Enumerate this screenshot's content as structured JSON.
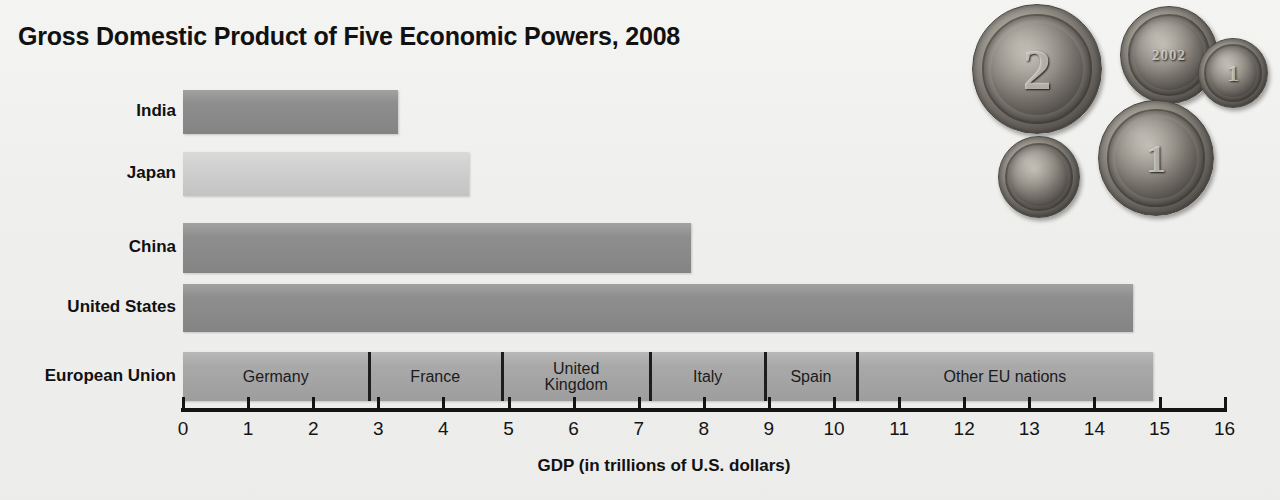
{
  "chart_data": {
    "type": "bar",
    "orientation": "horizontal",
    "title": "Gross Domestic Product of Five Economic Powers, 2008",
    "xlabel": "GDP (in trillions of U.S. dollars)",
    "ylabel": "",
    "xlim": [
      0,
      16
    ],
    "xticks": [
      0,
      1,
      2,
      3,
      4,
      5,
      6,
      7,
      8,
      9,
      10,
      11,
      12,
      13,
      14,
      15,
      16
    ],
    "grid": false,
    "legend": "none",
    "categories": [
      "India",
      "Japan",
      "China",
      "United States",
      "European Union"
    ],
    "values": [
      3.3,
      4.4,
      7.8,
      14.6,
      14.9
    ],
    "bar_colors": [
      "#8e8e8e",
      "#d2d2d2",
      "#8e8e8e",
      "#8e8e8e",
      "#a9a9a9"
    ],
    "stacked_category": "European Union",
    "segments": [
      {
        "label": "Germany",
        "value": 2.85,
        "start": 0.0,
        "end": 2.85
      },
      {
        "label": "France",
        "value": 2.05,
        "start": 2.85,
        "end": 4.9
      },
      {
        "label": "United\nKingdom",
        "value": 2.28,
        "start": 4.9,
        "end": 7.18
      },
      {
        "label": "Italy",
        "value": 1.76,
        "start": 7.18,
        "end": 8.94
      },
      {
        "label": "Spain",
        "value": 1.41,
        "start": 8.94,
        "end": 10.35
      },
      {
        "label": "Other EU nations",
        "value": 4.55,
        "start": 10.35,
        "end": 14.9
      }
    ]
  },
  "figure": {
    "title": "Gross Domestic Product of Five Economic Powers, 2008",
    "axis_title": "GDP (in trillions of U.S. dollars)",
    "background_color": "#f1f1ef",
    "axis_color": "#141414"
  },
  "photo": {
    "name": "euro-coins-photograph",
    "coins": [
      {
        "id": "coin-2euro",
        "glyph": "2"
      },
      {
        "id": "coin-estonia",
        "glyph": "2002"
      },
      {
        "id": "coin-small",
        "glyph": "1"
      },
      {
        "id": "coin-cyprus",
        "glyph": ""
      },
      {
        "id": "coin-1euro",
        "glyph": "1"
      }
    ]
  }
}
